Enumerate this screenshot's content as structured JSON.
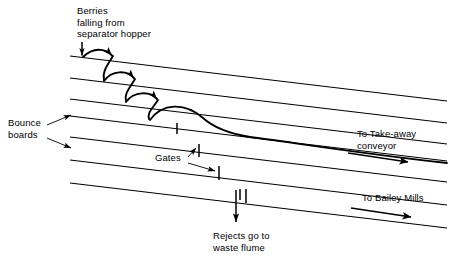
{
  "diagram": {
    "background_color": "#ffffff",
    "line_color": "#000000",
    "text_color": "#000000",
    "labels": {
      "berries": "Berries\nfalling from\nseparator hopper",
      "bounce_boards": "Bounce\nboards",
      "gates": "Gates",
      "takeaway_conveyor": "To Take-away\nconveyor",
      "bailey_mills": "To Bailey Mills",
      "rejects": "Rejects go to\nwaste flume"
    },
    "elements": {
      "boards_count": 7,
      "bounce_arcs_count": 3,
      "gate_ticks_count": 5,
      "flow_arrows": [
        "take-away-conveyor-arrow",
        "bailey-mills-arrow",
        "rejects-down-arrow",
        "berries-drop-arrow"
      ]
    }
  }
}
